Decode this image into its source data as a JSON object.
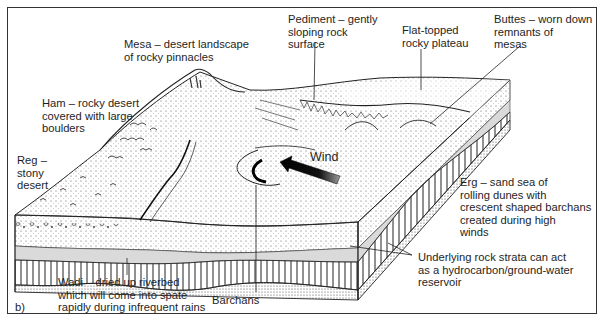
{
  "figure": {
    "panel_label": "b)"
  },
  "labels": {
    "mesa": "Mesa – desert landscape\nof rocky pinnacles",
    "pediment": "Pediment – gently\nsloping rock\nsurface",
    "plateau": "Flat-topped\nrocky plateau",
    "buttes": "Buttes – worn down\nremnants of\nmesas",
    "ham": "Ham – rocky desert\ncovered with large\nboulders",
    "reg": "Reg –\nstony\ndesert",
    "wind": "Wind",
    "erg": "Erg – sand sea of\nrolling dunes with\ncrescent shaped barchans\ncreated during high\nwinds",
    "strata": "Underlying rock strata can act\nas a hydrocarbon/ground-water\nreservoir",
    "wadi": "Wadi – dried up riverbed\nwhich will come into spate\nrapidly during infrequent rains",
    "barchans": "Barchans"
  },
  "colors": {
    "ink": "#1a1a1a",
    "frame": "#333333",
    "sand_shade": "#d9d9d9",
    "background": "#ffffff"
  }
}
